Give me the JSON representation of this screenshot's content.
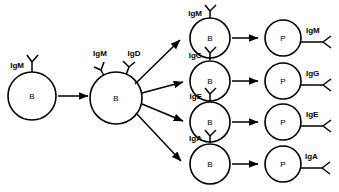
{
  "diagram": {
    "background_color": "#ffffff",
    "stroke_color": "#000000",
    "cell_letters": {
      "b_cell": "B",
      "plasma_cell": "P"
    },
    "naive_cell": {
      "label": "B",
      "receptors": [
        {
          "name": "IgM",
          "label": "IgM"
        }
      ]
    },
    "activated_cell": {
      "label": "B",
      "receptors": [
        {
          "name": "IgM",
          "label": "IgM"
        },
        {
          "name": "IgD",
          "label": "IgD"
        }
      ]
    },
    "switched_rows": [
      {
        "isotype": "IgM",
        "b_cell_label": "B",
        "b_cell_receptor_label": "IgM",
        "plasma_cell_label": "P",
        "secreted_label": "IgM"
      },
      {
        "isotype": "IgG",
        "b_cell_label": "B",
        "b_cell_receptor_label": "IgG",
        "plasma_cell_label": "P",
        "secreted_label": "IgG"
      },
      {
        "isotype": "IgE",
        "b_cell_label": "B",
        "b_cell_receptor_label": "IgE",
        "plasma_cell_label": "P",
        "secreted_label": "IgE"
      },
      {
        "isotype": "IgA",
        "b_cell_label": "B",
        "b_cell_receptor_label": "IgA",
        "plasma_cell_label": "P",
        "secreted_label": "IgA"
      }
    ]
  }
}
